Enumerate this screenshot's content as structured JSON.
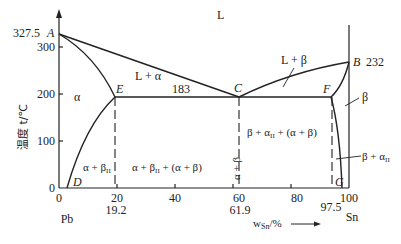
{
  "diagram": {
    "y_axis": {
      "label": "温度 t/℃",
      "ticks": [
        "0",
        "100",
        "200",
        "300"
      ],
      "special_tick": "327.5"
    },
    "x_axis": {
      "label": "w",
      "label_sub": "Sn",
      "label_unit": "/%",
      "ticks": [
        "0",
        "20",
        "40",
        "60",
        "80",
        "100"
      ],
      "special_ticks": [
        "19.2",
        "61.9",
        "97.5"
      ],
      "left_element": "Pb",
      "right_element": "Sn"
    },
    "points": {
      "A": "A",
      "B": "B",
      "C": "C",
      "D": "D",
      "E": "E",
      "F": "F",
      "G": "G"
    },
    "point_values": {
      "B_temp": "232",
      "eutectic_temp": "183"
    },
    "regions": {
      "liquid": "L",
      "l_alpha": "L + α",
      "l_beta": "L + β",
      "alpha": "α",
      "beta": "β",
      "alpha_beta_ii": "α + β",
      "alpha_beta_ii_sub": "II",
      "hypo": "α + β",
      "hypo_sub": "II",
      "hypo_rest": " + (α + β)",
      "eutectic": "α + β",
      "hyper": "β + α",
      "hyper_sub": "II",
      "hyper_rest": " + (α + β)",
      "beta_alpha_ii": "β + α",
      "beta_alpha_ii_sub": "II"
    }
  }
}
